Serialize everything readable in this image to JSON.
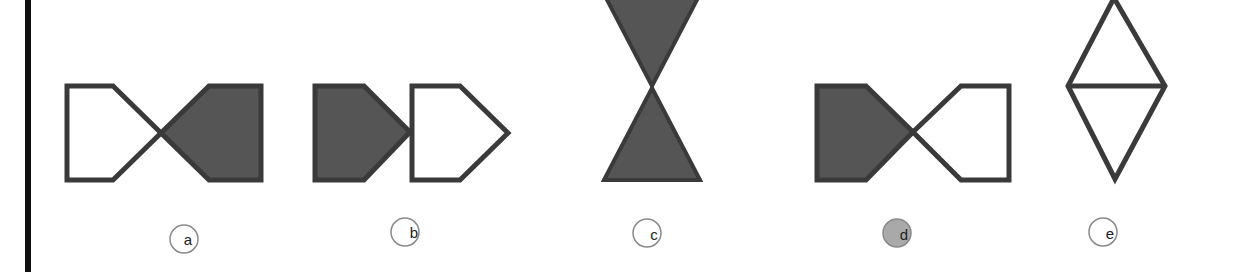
{
  "colors": {
    "stroke": "#3a3a3a",
    "fill_dark": "#555555",
    "fill_light": "#ffffff",
    "label_ring": "#8a8a8a",
    "selected_fill": "#a9a9a9",
    "left_bar": "#111111"
  },
  "options": [
    {
      "id": "a",
      "label": "a",
      "description": "Two pentagons meeting at a point; left outline, right filled",
      "selected": false
    },
    {
      "id": "b",
      "label": "b",
      "description": "Two pentagons pointing right; left filled, right outline",
      "selected": false
    },
    {
      "id": "c",
      "label": "c",
      "description": "Two filled triangles meeting at apex (hourglass)",
      "selected": false
    },
    {
      "id": "d",
      "label": "d",
      "description": "Two pentagons meeting at a point; left filled, right outline",
      "selected": true
    },
    {
      "id": "e",
      "label": "e",
      "description": "Outlined diamond split by a horizontal line",
      "selected": false
    }
  ]
}
